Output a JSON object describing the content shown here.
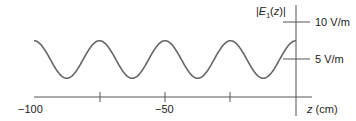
{
  "chart_data": {
    "type": "line",
    "title": "|E1(z)|",
    "xlabel": "z (cm)",
    "ylabel": "|E1(z)|",
    "xlim": [
      -100,
      0
    ],
    "ylim": [
      0,
      10
    ],
    "x_ticks": [
      -100,
      -75,
      -50,
      -25,
      0
    ],
    "x_tick_labels": [
      "-100",
      "",
      "-50",
      "",
      ""
    ],
    "y_ticks": [
      5,
      10
    ],
    "y_tick_labels": [
      "5 V/m",
      "10 V/m"
    ],
    "grid": false,
    "series": [
      {
        "name": "|E1(z)|",
        "description": "Standing-wave magnitude oscillating between 2.5 and 7.5 V/m with period 25 cm; maxima at z = 0, -25, -50, -75, -100 cm; minima at z = -12.5, -37.5, -62.5, -87.5 cm",
        "x": [
          -100,
          -87.5,
          -75,
          -62.5,
          -50,
          -37.5,
          -25,
          -12.5,
          0
        ],
        "values": [
          7.5,
          2.5,
          7.5,
          2.5,
          7.5,
          2.5,
          7.5,
          2.5,
          7.5
        ]
      }
    ],
    "color": "#666666"
  },
  "labels": {
    "y_title_prefix": "|",
    "y_title_E": "E",
    "y_title_sub": "1",
    "y_title_z": "(z)",
    "y_title_suffix": "|",
    "tick_10": "10 V/m",
    "tick_5": "5 V/m",
    "x_neg100": "−100",
    "x_neg50": "−50",
    "x_title": "z",
    "x_unit": " (cm)"
  }
}
